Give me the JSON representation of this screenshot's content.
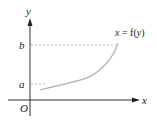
{
  "diagram": {
    "axes": {
      "x_label": "x",
      "y_label": "y",
      "origin_label": "O"
    },
    "levels": {
      "a_label": "a",
      "b_label": "b"
    },
    "curve": {
      "label_x": "x",
      "label_eq": " = f(",
      "label_y": "y",
      "label_close": ")"
    },
    "colors": {
      "axis": "#333333",
      "curve": "#b0b0b0",
      "dashed": "#b8b8b8",
      "text": "#222222"
    }
  }
}
